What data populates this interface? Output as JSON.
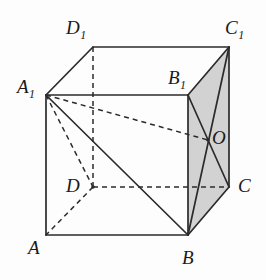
{
  "figure": {
    "kind": "geometry-diagram",
    "background_color": "#fdfdfd",
    "line_color": "#2b2b2b",
    "shaded_face_color": "#d2d2d2",
    "canvas": {
      "width": 266,
      "height": 280
    }
  },
  "vertices": [
    {
      "id": "A",
      "label": "A",
      "sub": "",
      "x": 46,
      "y": 235,
      "label_x": 28,
      "label_y": 238
    },
    {
      "id": "B",
      "label": "B",
      "sub": "",
      "x": 188,
      "y": 235,
      "label_x": 182,
      "label_y": 248
    },
    {
      "id": "C",
      "label": "C",
      "sub": "",
      "x": 229,
      "y": 187,
      "label_x": 238,
      "label_y": 176
    },
    {
      "id": "D",
      "label": "D",
      "sub": "",
      "x": 93,
      "y": 187,
      "label_x": 66,
      "label_y": 176
    },
    {
      "id": "A1",
      "label": "A",
      "sub": "1",
      "x": 46,
      "y": 95,
      "label_x": 17,
      "label_y": 77
    },
    {
      "id": "B1",
      "label": "B",
      "sub": "1",
      "x": 188,
      "y": 95,
      "label_x": 168,
      "label_y": 68
    },
    {
      "id": "C1",
      "label": "C",
      "sub": "1",
      "x": 229,
      "y": 47,
      "label_x": 225,
      "label_y": 18
    },
    {
      "id": "D1",
      "label": "D",
      "sub": "1",
      "x": 93,
      "y": 47,
      "label_x": 66,
      "label_y": 18
    },
    {
      "id": "O",
      "label": "O",
      "sub": "",
      "x": 208,
      "y": 140,
      "label_x": 212,
      "label_y": 128
    }
  ],
  "shaded_face": {
    "name": "face-BCC1B1",
    "points": "188,95 229,47 229,187 188,235"
  },
  "solid_edges": [
    {
      "name": "edge-A-B",
      "x1": 46,
      "y1": 235,
      "x2": 188,
      "y2": 235
    },
    {
      "name": "edge-A-A1",
      "x1": 46,
      "y1": 235,
      "x2": 46,
      "y2": 95
    },
    {
      "name": "edge-A1-D1",
      "x1": 46,
      "y1": 95,
      "x2": 93,
      "y2": 47
    },
    {
      "name": "edge-D1-C1",
      "x1": 93,
      "y1": 47,
      "x2": 229,
      "y2": 47
    },
    {
      "name": "edge-A1-B1",
      "x1": 46,
      "y1": 95,
      "x2": 188,
      "y2": 95
    },
    {
      "name": "edge-B1-C1",
      "x1": 188,
      "y1": 95,
      "x2": 229,
      "y2": 47
    },
    {
      "name": "edge-C1-C",
      "x1": 229,
      "y1": 47,
      "x2": 229,
      "y2": 187
    },
    {
      "name": "edge-B-C",
      "x1": 188,
      "y1": 235,
      "x2": 229,
      "y2": 187
    },
    {
      "name": "edge-B-B1",
      "x1": 188,
      "y1": 235,
      "x2": 188,
      "y2": 95
    },
    {
      "name": "diagonal-A1-B",
      "x1": 46,
      "y1": 95,
      "x2": 188,
      "y2": 235
    },
    {
      "name": "diagonal-B1-C",
      "x1": 188,
      "y1": 95,
      "x2": 229,
      "y2": 187
    },
    {
      "name": "diagonal-B-C1",
      "x1": 188,
      "y1": 235,
      "x2": 229,
      "y2": 47
    }
  ],
  "dashed_edges": [
    {
      "name": "edge-D-A",
      "x1": 93,
      "y1": 187,
      "x2": 46,
      "y2": 235
    },
    {
      "name": "edge-D-C",
      "x1": 93,
      "y1": 187,
      "x2": 229,
      "y2": 187
    },
    {
      "name": "edge-D-D1",
      "x1": 93,
      "y1": 187,
      "x2": 93,
      "y2": 47
    },
    {
      "name": "edge-A1-D",
      "x1": 46,
      "y1": 95,
      "x2": 93,
      "y2": 187
    },
    {
      "name": "segment-A1-O",
      "x1": 46,
      "y1": 95,
      "x2": 208,
      "y2": 140
    }
  ]
}
